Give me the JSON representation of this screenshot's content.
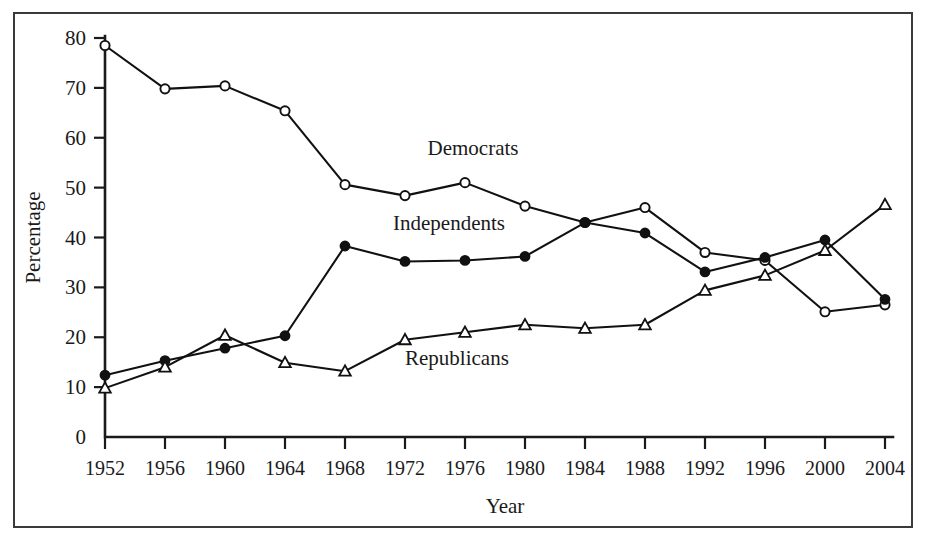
{
  "chart_data": {
    "type": "line",
    "title": "",
    "xlabel": "Year",
    "ylabel": "Percentage",
    "categories": [
      1952,
      1956,
      1960,
      1964,
      1968,
      1972,
      1976,
      1980,
      1984,
      1988,
      1992,
      1996,
      2000,
      2004
    ],
    "xtick_labels": [
      "1952",
      "1956",
      "1960",
      "1964",
      "1968",
      "1972",
      "1976",
      "1980",
      "1984",
      "1988",
      "1992",
      "1996",
      "2000",
      "2004"
    ],
    "ytick_labels": [
      "0",
      "10",
      "20",
      "30",
      "40",
      "50",
      "60",
      "70",
      "80"
    ],
    "yticks": [
      0,
      10,
      20,
      30,
      40,
      50,
      60,
      70,
      80
    ],
    "ylim": [
      0,
      80
    ],
    "xlim": [
      1952,
      2004
    ],
    "grid": false,
    "legend_position": "inline-annotations",
    "series": [
      {
        "name": "Democrats",
        "marker": "open-circle",
        "values": [
          78.5,
          69.8,
          70.4,
          65.4,
          50.6,
          48.4,
          51.0,
          46.3,
          43.0,
          46.0,
          37.0,
          35.4,
          25.1,
          26.5
        ]
      },
      {
        "name": "Independents",
        "marker": "filled-circle",
        "values": [
          12.4,
          15.3,
          17.8,
          20.3,
          38.3,
          35.2,
          35.4,
          36.2,
          43.0,
          40.9,
          33.1,
          36.0,
          39.5,
          27.6
        ]
      },
      {
        "name": "Republicans",
        "marker": "open-triangle",
        "values": [
          9.8,
          14.0,
          20.4,
          14.9,
          13.2,
          19.5,
          21.0,
          22.5,
          21.8,
          22.5,
          29.4,
          32.4,
          37.4,
          46.6
        ]
      }
    ],
    "annotations": [
      {
        "text": "Democrats",
        "x": 1973.5,
        "y": 56.5
      },
      {
        "text": "Independents",
        "x": 1971.2,
        "y": 41.5
      },
      {
        "text": "Republicans",
        "x": 1972.0,
        "y": 14.5
      }
    ]
  }
}
